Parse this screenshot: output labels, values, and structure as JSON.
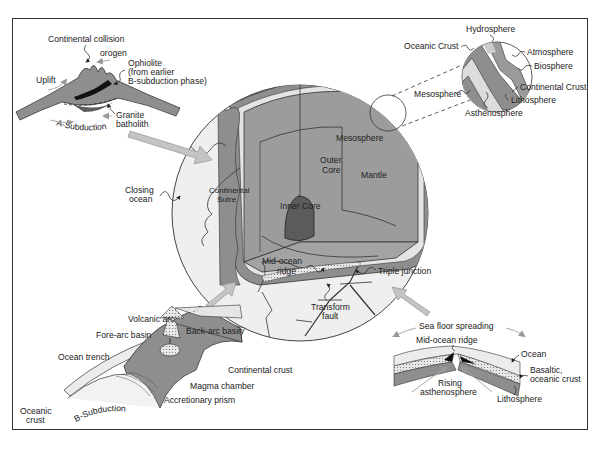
{
  "diagram": {
    "type": "earth-structure-plate-tectonics",
    "colors": {
      "frame": "#333333",
      "globe_surface": "#efefef",
      "crust_dark": "#8c8c8c",
      "mantle": "#9a9a9a",
      "outer_core": "#a6a6a6",
      "inner_core": "#5a5a5a",
      "light_band": "#e6e6e6",
      "arrow_gray": "#bdbdbd",
      "black_ophiolite": "#111111"
    },
    "globe": {
      "layers": {
        "mesosphere": "Mesosphere",
        "outer_core": "Outer\nCore",
        "outer_core_l1": "Outer",
        "outer_core_l2": "Core",
        "mantle": "Mantle",
        "inner_core": "Inner Core"
      },
      "surface_labels": {
        "closing_ocean_l1": "Closing",
        "closing_ocean_l2": "ocean",
        "continental_sutre_l1": "Continental",
        "continental_sutre_l2": "Sutre",
        "mid_ocean_ridge_l1": "Mid-ocean",
        "mid_ocean_ridge_l2": "ridge",
        "triple_junction": "Triple junction",
        "transform_fault_l1": "Transform",
        "transform_fault_l2": "fault"
      }
    },
    "inset_collision": {
      "continental_collision": "Continental collision",
      "orogen": "orogen",
      "ophiolite_l1": "Ophiolite",
      "ophiolite_l2": "(from earlier",
      "ophiolite_l3": "B-subduction phase)",
      "uplift": "Uplift",
      "granite_l1": "Granite",
      "granite_l2": "batholith",
      "a_subduction": "A-Subduction"
    },
    "inset_spheres": {
      "hydrosphere": "Hydrosphere",
      "oceanic_crust": "Oceanic Crust",
      "atmosphere": "Atmosphere",
      "biosphere": "Biosphere",
      "mesosphere": "Mesosphere",
      "continental_crust": "Continental Crust",
      "lithosphere": "Lithosphere",
      "asthenosphere": "Asthenosphere"
    },
    "inset_subduction": {
      "volcanic_arc": "Volcanic arc",
      "back_arc_basin": "Back-arc basin",
      "fore_arc_basin": "Fore-arc basin",
      "ocean_trench": "Ocean trench",
      "continental_crust": "Continental crust",
      "magma_chamber": "Magma chamber",
      "accretionary_prism": "Accretionary prism",
      "oceanic_crust_l1": "Oceanic",
      "oceanic_crust_l2": "crust",
      "b_subduction": "B-Subduction"
    },
    "inset_spreading": {
      "sea_floor_spreading": "Sea floor spreading",
      "mid_ocean_ridge": "Mid-ocean ridge",
      "ocean": "Ocean",
      "basaltic_l1": "Basaltic,",
      "basaltic_l2": "oceanic crust",
      "rising_l1": "Rising",
      "rising_l2": "asthenosphere",
      "lithosphere": "Lithosphere"
    }
  }
}
